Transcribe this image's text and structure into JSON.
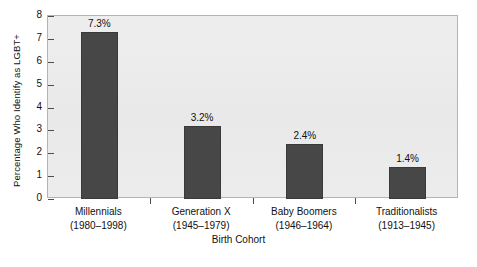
{
  "chart_data": {
    "type": "bar",
    "title": "",
    "xlabel": "Birth Cohort",
    "ylabel": "Percentage Who Identify as LGBT+",
    "categories": [
      "Millennials",
      "Generation X",
      "Baby Boomers",
      "Traditionalists"
    ],
    "category_sublabels": [
      "(1980–1998)",
      "(1945–1979)",
      "(1946–1964)",
      "(1913–1945)"
    ],
    "values": [
      7.3,
      3.2,
      2.4,
      1.4
    ],
    "data_labels": [
      "7.3%",
      "3.2%",
      "2.4%",
      "1.4%"
    ],
    "ylim": [
      0,
      8
    ],
    "ytick_labels": [
      "0",
      "1",
      "2",
      "3",
      "4",
      "5",
      "6",
      "7",
      "8"
    ],
    "ytick_values": [
      0,
      1,
      2,
      3,
      4,
      5,
      6,
      7,
      8
    ],
    "grid": false,
    "legend": "none",
    "colors": {
      "bar_fill": "#474747",
      "bar_edge": "#3a3a3a",
      "plot_background": "#ebebeb",
      "frame": "#b4b4b4",
      "page_background": "#ffffff",
      "text": "#111111"
    }
  }
}
